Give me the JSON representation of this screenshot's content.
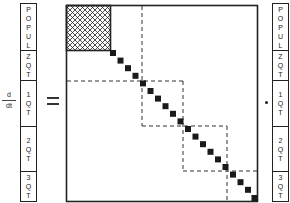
{
  "diagram": {
    "type": "block-matrix-equation",
    "operator": {
      "numerator": "d",
      "denominator": "dt",
      "equals": "=",
      "multiply": "·"
    },
    "left_vector": {
      "segments": [
        {
          "label": "POPUL",
          "chars": [
            "P",
            "O",
            "P",
            "U",
            "L"
          ]
        },
        {
          "label": "ZQT",
          "chars": [
            "Z",
            "Q",
            "T"
          ]
        },
        {
          "label": "1QT",
          "chars": [
            "1",
            "Q",
            "T"
          ]
        },
        {
          "label": "2QT",
          "chars": [
            "2",
            "Q",
            "T"
          ]
        },
        {
          "label": "3QT",
          "chars": [
            "3",
            "Q",
            "T"
          ]
        }
      ]
    },
    "right_vector": {
      "segments": [
        {
          "label": "POPUL",
          "chars": [
            "P",
            "O",
            "P",
            "U",
            "L"
          ]
        },
        {
          "label": "ZQT",
          "chars": [
            "Z",
            "Q",
            "T"
          ]
        },
        {
          "label": "1QT",
          "chars": [
            "1",
            "Q",
            "T"
          ]
        },
        {
          "label": "2QT",
          "chars": [
            "2",
            "Q",
            "T"
          ]
        },
        {
          "label": "3QT",
          "chars": [
            "3",
            "Q",
            "T"
          ]
        }
      ]
    },
    "matrix": {
      "dense_block": "hatched POPUL×POPUL block",
      "diagonal": "filled squares along main diagonal",
      "dashed_blocks": [
        "ZQT+POPUL region",
        "1QT block",
        "2QT block",
        "3QT block"
      ]
    },
    "colors": {
      "ink": "#222222",
      "background": "#ffffff"
    }
  }
}
